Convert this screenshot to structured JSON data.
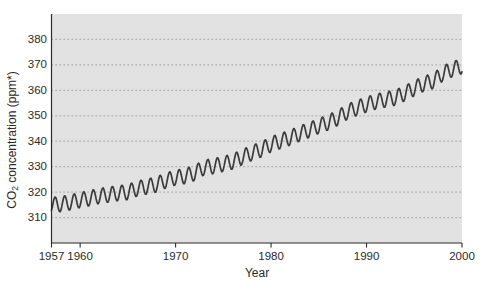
{
  "chart_data": {
    "type": "line",
    "title": "",
    "xlabel": "Year",
    "ylabel": "CO₂ concentration (ppm*)",
    "ylabel_parts": {
      "prefix": "CO",
      "sub": "2",
      "suffix": " concentration (ppm*)"
    },
    "xlim": [
      1957,
      2000
    ],
    "ylim": [
      300,
      390
    ],
    "x_ticks": [
      1957,
      1960,
      1970,
      1980,
      1990,
      2000
    ],
    "y_ticks": [
      310,
      320,
      330,
      340,
      350,
      360,
      370,
      380
    ],
    "grid": "horizontal-dotted",
    "legend": "none",
    "series": [
      {
        "name": "CO2 concentration",
        "start_year": 1957,
        "annual_means": [
          315.0,
          315.3,
          316.0,
          316.9,
          317.6,
          318.5,
          319.0,
          319.6,
          320.0,
          321.4,
          322.2,
          323.0,
          324.6,
          325.7,
          326.3,
          327.5,
          329.7,
          330.2,
          331.1,
          332.0,
          333.8,
          335.4,
          336.8,
          338.8,
          340.1,
          341.4,
          343.0,
          344.4,
          346.0,
          347.4,
          349.2,
          351.6,
          353.1,
          354.4,
          355.6,
          356.4,
          357.1,
          358.8,
          360.8,
          362.6,
          363.7,
          366.6,
          368.3,
          369.5
        ]
      }
    ],
    "seasonal": {
      "amplitude_ppm": 3,
      "peak_fraction": 0.38,
      "cycle": "annual"
    },
    "colors": {
      "plot_bg": "#e2e2e2",
      "grid": "#9a9a9a",
      "axis": "#2b2b2b",
      "line": "#3b3b3b",
      "text": "#2a2a2a"
    }
  }
}
